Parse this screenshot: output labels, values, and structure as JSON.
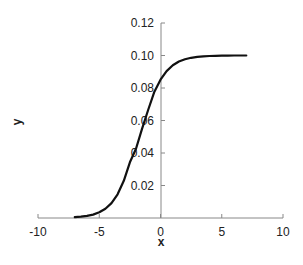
{
  "chart_data": {
    "type": "line",
    "title": "",
    "xlabel": "x",
    "ylabel": "y",
    "xlim": [
      -10,
      10
    ],
    "ylim": [
      0,
      0.12
    ],
    "x_ticks": [
      -10,
      -5,
      0,
      5,
      10
    ],
    "x_tick_labels": [
      "-10",
      "-5",
      "0",
      "5",
      "10"
    ],
    "y_ticks": [
      0.02,
      0.04,
      0.06,
      0.08,
      0.1,
      0.12
    ],
    "y_tick_labels": [
      "0.02",
      "0.04",
      "0.06",
      "0.08",
      "0.10",
      "0.12"
    ],
    "grid": false,
    "legend": null,
    "series": [
      {
        "name": "y",
        "color": "#111111",
        "x": [
          -7,
          -6.5,
          -6,
          -5.5,
          -5,
          -4.5,
          -4,
          -3.5,
          -3,
          -2.5,
          -2,
          -1.5,
          -1,
          -0.5,
          0,
          0.5,
          1,
          1.5,
          2,
          2.5,
          3,
          3.5,
          4,
          4.5,
          5,
          5.5,
          6,
          6.5,
          7
        ],
        "y": [
          0.0005,
          0.0008,
          0.0013,
          0.0021,
          0.0035,
          0.0057,
          0.0092,
          0.0146,
          0.0229,
          0.0343,
          0.0426,
          0.055,
          0.0668,
          0.0777,
          0.0851,
          0.0904,
          0.094,
          0.0963,
          0.0977,
          0.0986,
          0.0992,
          0.0995,
          0.0997,
          0.0998,
          0.0999,
          0.0999,
          0.1,
          0.1,
          0.1
        ]
      }
    ]
  }
}
